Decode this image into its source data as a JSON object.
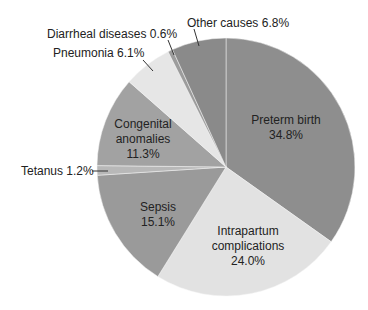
{
  "chart_data": {
    "type": "pie",
    "title": "",
    "center": [
      226,
      167
    ],
    "radius": 129,
    "start_angle_deg": 0,
    "direction": "clockwise",
    "slices": [
      {
        "name": "Preterm birth",
        "value": 34.8,
        "label": "Preterm birth",
        "pct": "34.8%",
        "color": "#8e8e8e"
      },
      {
        "name": "Intrapartum complications",
        "value": 24.0,
        "label": "Intrapartum complications",
        "pct": "24.0%",
        "color": "#e2e2e2"
      },
      {
        "name": "Sepsis",
        "value": 15.1,
        "label": "Sepsis",
        "pct": "15.1%",
        "color": "#9a9a9a"
      },
      {
        "name": "Tetanus",
        "value": 1.2,
        "label": "Tetanus 1.2%",
        "pct": "1.2%",
        "color": "#b8b8b8"
      },
      {
        "name": "Congenital anomalies",
        "value": 11.3,
        "label": "Congenital anomalies",
        "pct": "11.3%",
        "color": "#a2a2a2"
      },
      {
        "name": "Pneumonia",
        "value": 6.1,
        "label": "Pneumonia 6.1%",
        "pct": "6.1%",
        "color": "#e6e6e6"
      },
      {
        "name": "Diarrheal diseases",
        "value": 0.6,
        "label": "Diarrheal diseases 0.6%",
        "pct": "0.6%",
        "color": "#9c9c9c"
      },
      {
        "name": "Other causes",
        "value": 6.8,
        "label": "Other causes 6.8%",
        "pct": "6.8%",
        "color": "#8a8a8a"
      }
    ],
    "legend": "none"
  },
  "labels": {
    "preterm_name": "Preterm birth",
    "preterm_pct": "34.8%",
    "intrapartum_line1": "Intrapartum",
    "intrapartum_line2": "complications",
    "intrapartum_pct": "24.0%",
    "sepsis_name": "Sepsis",
    "sepsis_pct": "15.1%",
    "congenital_line1": "Congenital",
    "congenital_line2": "anomalies",
    "congenital_pct": "11.3%",
    "tetanus": "Tetanus 1.2%",
    "pneumonia": "Pneumonia 6.1%",
    "diarrheal": "Diarrheal diseases 0.6%",
    "other": "Other causes 6.8%"
  }
}
